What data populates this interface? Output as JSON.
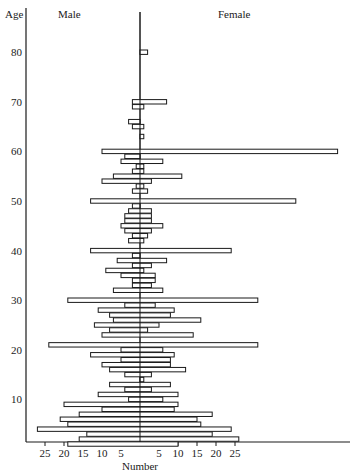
{
  "chart_data": {
    "type": "bar",
    "subtype": "population-pyramid",
    "title": "",
    "xlabel": "Number",
    "ylabel": "Age",
    "left_label": "Male",
    "right_label": "Female",
    "x_ticks_left": [
      25,
      20,
      15,
      10,
      5
    ],
    "x_ticks_right": [
      5,
      10,
      15,
      20,
      25
    ],
    "y_ticks": [
      10,
      20,
      30,
      40,
      50,
      60,
      70,
      80
    ],
    "xlim": [
      -27,
      53
    ],
    "ylim": [
      0,
      84
    ],
    "grid": false,
    "bars": [
      {
        "age": 80,
        "male": 0,
        "female": 2
      },
      {
        "age": 70,
        "male": 2,
        "female": 7
      },
      {
        "age": 69,
        "male": 2,
        "female": 1
      },
      {
        "age": 66,
        "male": 3,
        "female": 0
      },
      {
        "age": 65,
        "male": 2,
        "female": 1
      },
      {
        "age": 63,
        "male": 0,
        "female": 1
      },
      {
        "age": 60,
        "male": 10,
        "female": 52
      },
      {
        "age": 59,
        "male": 4,
        "female": 0
      },
      {
        "age": 58,
        "male": 5,
        "female": 6
      },
      {
        "age": 57,
        "male": 1,
        "female": 1
      },
      {
        "age": 56,
        "male": 2,
        "female": 1
      },
      {
        "age": 55,
        "male": 7,
        "female": 11
      },
      {
        "age": 54,
        "male": 10,
        "female": 3
      },
      {
        "age": 53,
        "male": 1,
        "female": 1
      },
      {
        "age": 52,
        "male": 2,
        "female": 2
      },
      {
        "age": 50,
        "male": 13,
        "female": 41
      },
      {
        "age": 49,
        "male": 2,
        "female": 0
      },
      {
        "age": 48,
        "male": 3,
        "female": 3
      },
      {
        "age": 47,
        "male": 4,
        "female": 3
      },
      {
        "age": 46,
        "male": 4,
        "female": 3
      },
      {
        "age": 45,
        "male": 5,
        "female": 6
      },
      {
        "age": 44,
        "male": 4,
        "female": 3
      },
      {
        "age": 43,
        "male": 2,
        "female": 2
      },
      {
        "age": 42,
        "male": 3,
        "female": 1
      },
      {
        "age": 40,
        "male": 13,
        "female": 24
      },
      {
        "age": 39,
        "male": 2,
        "female": 0
      },
      {
        "age": 38,
        "male": 6,
        "female": 7
      },
      {
        "age": 37,
        "male": 2,
        "female": 3
      },
      {
        "age": 36,
        "male": 9,
        "female": 1
      },
      {
        "age": 35,
        "male": 5,
        "female": 4
      },
      {
        "age": 34,
        "male": 2,
        "female": 4
      },
      {
        "age": 33,
        "male": 2,
        "female": 3
      },
      {
        "age": 32,
        "male": 7,
        "female": 6
      },
      {
        "age": 30,
        "male": 19,
        "female": 31
      },
      {
        "age": 29,
        "male": 4,
        "female": 4
      },
      {
        "age": 28,
        "male": 11,
        "female": 9
      },
      {
        "age": 27,
        "male": 8,
        "female": 8
      },
      {
        "age": 26,
        "male": 7,
        "female": 16
      },
      {
        "age": 25,
        "male": 12,
        "female": 5
      },
      {
        "age": 24,
        "male": 8,
        "female": 2
      },
      {
        "age": 23,
        "male": 10,
        "female": 14
      },
      {
        "age": 21,
        "male": 24,
        "female": 31
      },
      {
        "age": 20,
        "male": 5,
        "female": 6
      },
      {
        "age": 19,
        "male": 13,
        "female": 9
      },
      {
        "age": 18,
        "male": 5,
        "female": 8
      },
      {
        "age": 17,
        "male": 10,
        "female": 8
      },
      {
        "age": 16,
        "male": 8,
        "female": 12
      },
      {
        "age": 15,
        "male": 4,
        "female": 3
      },
      {
        "age": 14,
        "male": 0,
        "female": 1
      },
      {
        "age": 13,
        "male": 8,
        "female": 8
      },
      {
        "age": 12,
        "male": 4,
        "female": 3
      },
      {
        "age": 11,
        "male": 11,
        "female": 10
      },
      {
        "age": 10,
        "male": 3,
        "female": 6
      },
      {
        "age": 9,
        "male": 20,
        "female": 10
      },
      {
        "age": 8,
        "male": 10,
        "female": 9
      },
      {
        "age": 7,
        "male": 16,
        "female": 19
      },
      {
        "age": 6,
        "male": 21,
        "female": 15
      },
      {
        "age": 5,
        "male": 19,
        "female": 16
      },
      {
        "age": 4,
        "male": 27,
        "female": 24
      },
      {
        "age": 3,
        "male": 14,
        "female": 19
      },
      {
        "age": 2,
        "male": 16,
        "female": 26
      },
      {
        "age": 1,
        "male": 19,
        "female": 10
      }
    ]
  }
}
